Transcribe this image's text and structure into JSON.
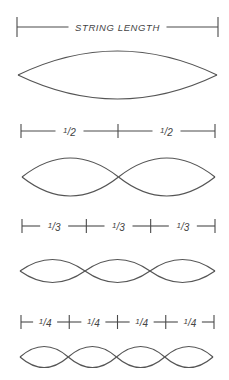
{
  "diagram": {
    "sections": [
      {
        "harmonic": 1,
        "segments": 1,
        "segment_label": "STRING LENGTH",
        "label_style": "full"
      },
      {
        "harmonic": 2,
        "segments": 2,
        "segment_label": "1/2",
        "label_style": "fraction"
      },
      {
        "harmonic": 3,
        "segments": 3,
        "segment_label": "1/3",
        "label_style": "fraction"
      },
      {
        "harmonic": 4,
        "segments": 4,
        "segment_label": "1/4",
        "label_style": "fraction"
      }
    ],
    "colors": {
      "line": "#4a4a4a",
      "wave": "#555555",
      "text": "#444444",
      "background": "#ffffff"
    }
  }
}
